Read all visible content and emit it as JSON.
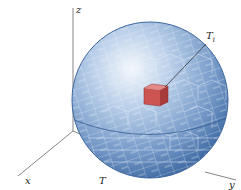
{
  "diagram": {
    "type": "3d-solid-partition",
    "axes": {
      "z_label": "z",
      "x_label": "x",
      "y_label": "y"
    },
    "solid_label": "T",
    "highlight": {
      "label_main": "T",
      "label_sub": "i"
    },
    "colors": {
      "sphere_dark": "#3f6ea6",
      "sphere_mid": "#7fa3cf",
      "sphere_light": "#dfe9f5",
      "grid": "#e8f0fa",
      "box_red": "#c9504f",
      "box_red_top": "#e07a76",
      "axis": "#555555"
    }
  }
}
